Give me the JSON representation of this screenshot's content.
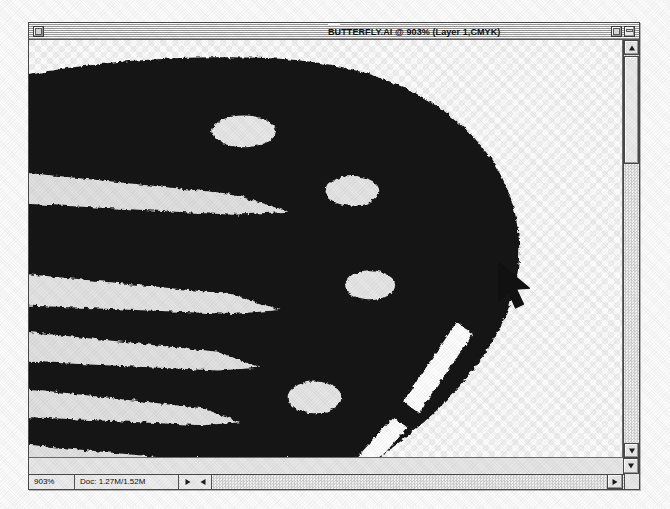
{
  "window": {
    "title": "BUTTERFLY.AI @ 903% (Layer 1,CMYK)",
    "document_name": "BUTTERFLY.AI",
    "zoom_in_title": "903%",
    "layer_info": "Layer 1,CMYK",
    "close_box": "close-box",
    "zoom_box": "zoom-box",
    "collapse_box": "collapse-box"
  },
  "status_bar": {
    "zoom_level": "903%",
    "doc_size": "Doc: 1.27M/1.52M",
    "doc_size_used": "1.27M",
    "doc_size_total": "1.52M",
    "nav_prev_icon": "triangle-right-icon",
    "nav_next_icon": "triangle-left-icon"
  },
  "scrollbars": {
    "vertical": {
      "up_arrow_icon": "triangle-up-icon",
      "down_arrow_icon": "triangle-down-icon",
      "thumb": "scroll-thumb"
    },
    "horizontal": {
      "left_arrow_icon": "triangle-left-icon",
      "right_arrow_icon": "triangle-right-icon"
    }
  },
  "canvas": {
    "transparency_checker": {
      "cell_size": 6,
      "light": "#ffffff",
      "dark": "#f0f0f0"
    },
    "artwork_name": "butterfly-wing",
    "colors": {
      "wing_dark": "#151515",
      "spot_light": "#e8e8e8",
      "streak_light": "#e3e3e3",
      "dash_white": "#ffffff"
    }
  },
  "cursor": {
    "type": "arrow-pointer",
    "x": 510,
    "y": 272
  },
  "palette": {
    "window_chrome": "#e8e8e8",
    "frame_border": "#4a4a4a",
    "title_stripe": "#9a9a9a",
    "status_field_bg": "#eeeeee",
    "page_backdrop": "#fdfdfd"
  }
}
